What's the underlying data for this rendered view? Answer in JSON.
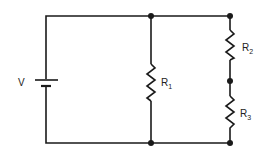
{
  "diagram": {
    "source": {
      "label": "V"
    },
    "resistors": [
      {
        "name": "R",
        "sub": "1"
      },
      {
        "name": "R",
        "sub": "2"
      },
      {
        "name": "R",
        "sub": "3"
      }
    ],
    "colors": {
      "wire": "#1a1a1a",
      "background": "#ffffff"
    }
  }
}
